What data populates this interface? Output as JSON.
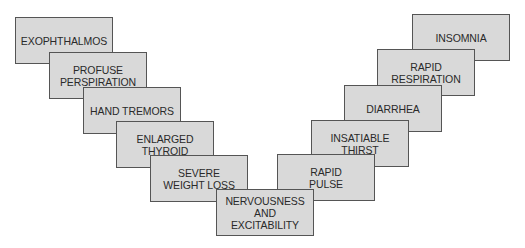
{
  "colors": {
    "box_fill": "#d9d9d9",
    "box_border": "#555555",
    "text": "#2a2a2a"
  },
  "boxes": [
    {
      "id": "exophthalmos",
      "label": "EXOPHTHALMOS",
      "x": 15,
      "y": 17,
      "z": 1
    },
    {
      "id": "profuse-perspiration",
      "label": "PROFUSE\nPERSPIRATION",
      "x": 49,
      "y": 52,
      "z": 2
    },
    {
      "id": "hand-tremors",
      "label": "HAND TREMORS",
      "x": 83,
      "y": 87,
      "z": 3
    },
    {
      "id": "enlarged-thyroid",
      "label": "ENLARGED\nTHYROID",
      "x": 116,
      "y": 121,
      "z": 4
    },
    {
      "id": "severe-weight-loss",
      "label": "SEVERE\nWEIGHT LOSS",
      "x": 150,
      "y": 155,
      "z": 5
    },
    {
      "id": "insomnia",
      "label": "INSOMNIA",
      "x": 412,
      "y": 14,
      "z": 1
    },
    {
      "id": "rapid-respiration",
      "label": "RAPID\nRESPIRATION",
      "x": 377,
      "y": 49,
      "z": 2
    },
    {
      "id": "diarrhea",
      "label": "DIARRHEA",
      "x": 344,
      "y": 85,
      "z": 3
    },
    {
      "id": "insatiable-thirst",
      "label": "INSATIABLE\nTHIRST",
      "x": 311,
      "y": 120,
      "z": 4
    },
    {
      "id": "rapid-pulse",
      "label": "RAPID\nPULSE",
      "x": 277,
      "y": 154,
      "z": 5
    },
    {
      "id": "nervousness-and-excitability",
      "label": "NERVOUSNESS\nAND\nEXCITABILITY",
      "x": 216,
      "y": 189,
      "z": 6
    }
  ]
}
